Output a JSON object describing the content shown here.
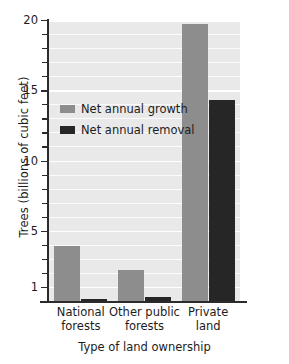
{
  "chart_data": {
    "type": "bar",
    "title": "",
    "xlabel": "Type of land ownership",
    "ylabel": "Trees (billions of cubic feet)",
    "categories": [
      "National forests",
      "Other public forests",
      "Private land"
    ],
    "category_lines": [
      [
        "National",
        "forests"
      ],
      [
        "Other public",
        "forests"
      ],
      [
        "Private",
        "land"
      ]
    ],
    "series": [
      {
        "name": "Net annual growth",
        "color": "#8d8d8d",
        "values": [
          3.9,
          2.2,
          19.7
        ]
      },
      {
        "name": "Net annual removal",
        "color": "#262626",
        "values": [
          0.15,
          0.3,
          14.3
        ]
      }
    ],
    "ylim": [
      0,
      20
    ],
    "yticks": [
      1,
      5,
      10,
      15,
      20
    ],
    "ytick_labels": [
      "1",
      "5",
      "10",
      "15",
      "20"
    ],
    "yticks_minor": [
      2,
      3,
      4,
      6,
      7,
      8,
      9,
      11,
      12,
      13,
      14,
      16,
      17,
      18,
      19
    ],
    "grid": true,
    "grid_orientation": "horizontal",
    "legend_position": "upper-left-inside",
    "plot_background": "#e9e9e9",
    "figure_background": "#ffffff"
  },
  "legend": {
    "items": [
      {
        "label": "Net annual growth",
        "swatch": "growth-swatch"
      },
      {
        "label": "Net annual removal",
        "swatch": "removal-swatch"
      }
    ]
  }
}
